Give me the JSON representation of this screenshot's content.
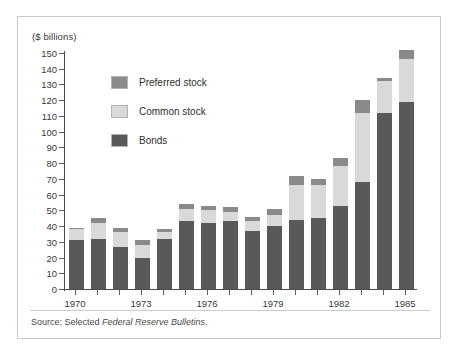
{
  "figure": {
    "units_label": "($ billions)",
    "source_prefix": "Source: Selected ",
    "source_italic": "Federal Reserve Bulletins",
    "source_suffix": "."
  },
  "legend": {
    "items": [
      {
        "label": "Preferred stock",
        "color": "#8a8a8a",
        "key": "preferred"
      },
      {
        "label": "Common stock",
        "color": "#d9d9d9",
        "key": "common"
      },
      {
        "label": "Bonds",
        "color": "#595959",
        "key": "bonds"
      }
    ]
  },
  "chart_data": {
    "type": "bar",
    "stacked": true,
    "title": "",
    "subtitle": "",
    "xlabel": "",
    "ylabel": "($ billions)",
    "ylim": [
      0,
      150
    ],
    "ytick_step": 10,
    "yticks": [
      0,
      10,
      20,
      30,
      40,
      50,
      60,
      70,
      80,
      90,
      100,
      110,
      120,
      130,
      140,
      150
    ],
    "ytick_labels": [
      "0",
      "10",
      "20",
      "30",
      "40",
      "50",
      "60",
      "70",
      "80",
      "90",
      "100",
      "110",
      "120",
      "130",
      "140",
      "150"
    ],
    "grid": false,
    "legend_position": "inside-upper-left",
    "categories": [
      "1970",
      "1971",
      "1972",
      "1973",
      "1974",
      "1975",
      "1976",
      "1977",
      "1978",
      "1979",
      "1980",
      "1981",
      "1982",
      "1983",
      "1984",
      "1985"
    ],
    "xtick_labels": [
      "1970",
      "1973",
      "1976",
      "1979",
      "1982",
      "1985"
    ],
    "xtick_label_indices": [
      0,
      3,
      6,
      9,
      12,
      15
    ],
    "series": [
      {
        "name": "Bonds",
        "color": "#595959",
        "values": [
          31,
          32,
          27,
          20,
          32,
          43,
          42,
          43,
          37,
          40,
          44,
          45,
          53,
          68,
          112,
          119
        ]
      },
      {
        "name": "Common stock",
        "color": "#d9d9d9",
        "values": [
          7,
          10,
          9,
          8,
          4,
          8,
          8,
          6,
          6,
          7,
          22,
          21,
          25,
          44,
          20,
          27
        ]
      },
      {
        "name": "Preferred stock",
        "color": "#8a8a8a",
        "values": [
          1,
          3,
          3,
          3,
          2,
          3,
          3,
          3,
          3,
          4,
          6,
          4,
          5,
          8,
          2,
          6
        ]
      }
    ],
    "totals": [
      39,
      45,
      39,
      31,
      38,
      54,
      53,
      52,
      46,
      51,
      72,
      70,
      83,
      120,
      134,
      152
    ]
  }
}
